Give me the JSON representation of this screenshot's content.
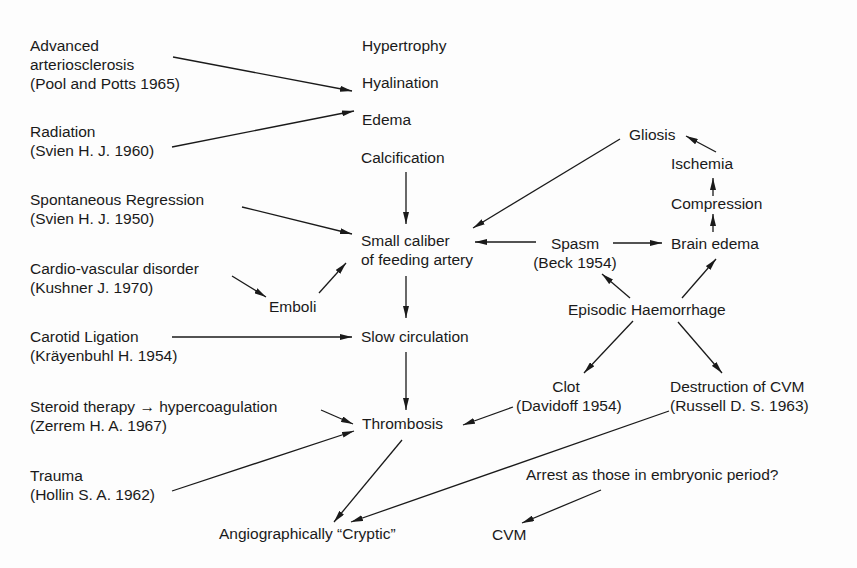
{
  "diagram": {
    "causes": {
      "arteriosclerosis": {
        "line1": "Advanced",
        "line2": "arteriosclerosis",
        "ref": "(Pool and Potts 1965)"
      },
      "radiation": {
        "line1": "Radiation",
        "ref": "(Svien H. J. 1960)"
      },
      "regression": {
        "line1": "Spontaneous Regression",
        "ref": "(Svien H. J. 1950)"
      },
      "cardio": {
        "line1": "Cardio-vascular disorder",
        "ref": "(Kushner J. 1970)"
      },
      "carotid": {
        "line1": "Carotid Ligation",
        "ref": "(Kräyenbuhl H. 1954)"
      },
      "steroid": {
        "line1": "Steroid therapy → hypercoagulation",
        "ref": "(Zerrem H. A. 1967)"
      },
      "trauma": {
        "line1": "Trauma",
        "ref": "(Hollin S. A. 1962)"
      }
    },
    "vessel_changes": {
      "hypertrophy": "Hypertrophy",
      "hyalination": "Hyalination",
      "edema": "Edema",
      "calcification": "Calcification"
    },
    "central": {
      "small_caliber_line1": "Small caliber",
      "small_caliber_line2": "of feeding artery",
      "emboli": "Emboli",
      "slow_circulation": "Slow circulation",
      "thrombosis": "Thrombosis",
      "cryptic": "Angiographically “Cryptic”"
    },
    "right": {
      "gliosis": "Gliosis",
      "ischemia": "Ischemia",
      "compression": "Compression",
      "brain_edema": "Brain edema",
      "spasm": "Spasm",
      "spasm_ref": "(Beck 1954)",
      "haemorrhage": "Episodic Haemorrhage",
      "clot": "Clot",
      "clot_ref": "(Davidoff 1954)",
      "destruction": "Destruction of CVM",
      "destruction_ref": "(Russell D. S. 1963)",
      "arrest": "Arrest as those in embryonic period?",
      "cvm": "CVM"
    }
  }
}
